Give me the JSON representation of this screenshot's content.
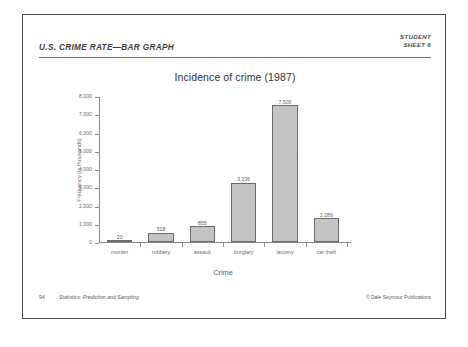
{
  "header": {
    "title": "U.S. CRIME RATE—BAR GRAPH",
    "meta_line1": "STUDENT",
    "meta_line2": "SHEET 6"
  },
  "footer": {
    "page_number": "94",
    "book_title": "Statistics: Prediction and Sampling",
    "copyright": "© Dale Seymour Publications"
  },
  "artifact": {
    "speck": "+"
  },
  "chart_data": {
    "type": "bar",
    "title": "Incidence of crime (1987)",
    "xlabel": "Crime",
    "ylabel": "Frequency (in thousands)",
    "categories": [
      "murder",
      "robbery",
      "assault",
      "burglary",
      "larceny",
      "car theft"
    ],
    "values": [
      20,
      518,
      855,
      3236,
      7500,
      1289
    ],
    "value_labels": [
      "20",
      "518",
      "855",
      "3,236",
      "7,500",
      "1,289"
    ],
    "ylim": [
      0,
      8000
    ],
    "ytick_values": [
      0,
      1000,
      2000,
      3000,
      4000,
      5000,
      6000,
      7000,
      8000
    ],
    "ytick_labels": [
      "0",
      "1,000",
      "2,000",
      "3,000",
      "4,000",
      "5,000",
      "6,000",
      "7,000",
      "8,000"
    ],
    "grid": false,
    "legend": "none",
    "bar_fill": "#c4c4c4",
    "bar_edge": "#6a6a6a"
  }
}
